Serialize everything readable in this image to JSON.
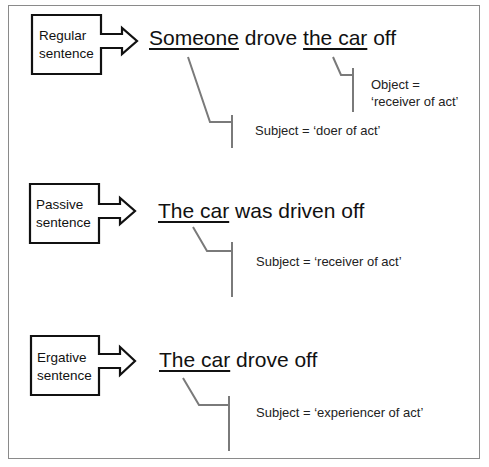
{
  "colors": {
    "box_stroke": "#111111",
    "bracket_stroke": "#7a7a7a",
    "frame_stroke": "#8a8a8a",
    "text": "#111111"
  },
  "rows": [
    {
      "label_line1": "Regular",
      "label_line2": "sentence",
      "sentence": {
        "part1_underlined": "Someone",
        "part2": " drove ",
        "part3_underlined": "the car",
        "part4": " off"
      },
      "notes": [
        {
          "line1": "Subject = ‘doer of act’"
        },
        {
          "line1": "Object =",
          "line2": "‘receiver of act’"
        }
      ]
    },
    {
      "label_line1": "Passive",
      "label_line2": "sentence",
      "sentence": {
        "part1_underlined": "The car",
        "part2": " was driven off"
      },
      "notes": [
        {
          "line1": "Subject = ‘receiver of act’"
        }
      ]
    },
    {
      "label_line1": "Ergative",
      "label_line2": "sentence",
      "sentence": {
        "part1_underlined": "The car",
        "part2": " drove off"
      },
      "notes": [
        {
          "line1": "Subject = ‘experiencer of act’"
        }
      ]
    }
  ]
}
